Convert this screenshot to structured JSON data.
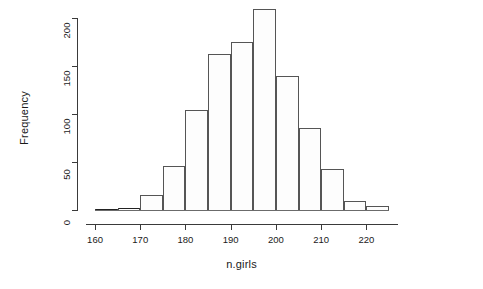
{
  "chart_data": {
    "type": "bar",
    "title": "",
    "subtitle": "",
    "xlabel": "n.girls",
    "ylabel": "Frequency",
    "xlim": [
      158,
      227
    ],
    "ylim": [
      0,
      210
    ],
    "grid": false,
    "legend": null,
    "bin_width": 5,
    "bin_edges": [
      160,
      165,
      170,
      175,
      180,
      185,
      190,
      195,
      200,
      205,
      210,
      215,
      220,
      225
    ],
    "categories": [
      "160-165",
      "165-170",
      "170-175",
      "175-180",
      "180-185",
      "185-190",
      "190-195",
      "195-200",
      "200-205",
      "205-210",
      "210-215",
      "215-220",
      "220-225"
    ],
    "values": [
      1,
      2,
      16,
      46,
      104,
      162,
      175,
      209,
      140,
      85,
      43,
      9,
      4
    ],
    "xticks": [
      160,
      170,
      180,
      190,
      200,
      210,
      220
    ],
    "xtick_labels": [
      "160",
      "170",
      "180",
      "190",
      "200",
      "210",
      "220"
    ],
    "yticks": [
      0,
      50,
      100,
      150,
      200
    ],
    "ytick_labels": [
      "0",
      "50",
      "100",
      "150",
      "200"
    ],
    "colors": {
      "bar_fill": "#fdfdfd",
      "bar_border": "#555555",
      "axis": "#3a3a3a",
      "text": "#1a1a1a",
      "background": "#ffffff"
    }
  }
}
